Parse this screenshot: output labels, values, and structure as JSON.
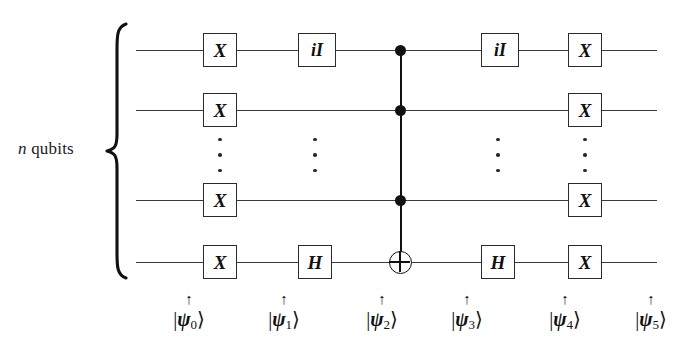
{
  "figure": {
    "type": "quantum-circuit-diagram",
    "left_label": {
      "symbol": "n",
      "text": "qubits"
    },
    "wire_count_shown": 4,
    "columns": [
      {
        "index": 0,
        "kind": "gate"
      },
      {
        "index": 1,
        "kind": "gate"
      },
      {
        "index": 2,
        "kind": "control-bus"
      },
      {
        "index": 3,
        "kind": "gate"
      },
      {
        "index": 4,
        "kind": "gate"
      }
    ]
  },
  "gates": {
    "row0": [
      {
        "label": "X",
        "x": 203,
        "wide": false
      },
      {
        "label": "iI",
        "x": 298,
        "wide": true
      },
      {
        "label": "iI",
        "x": 481,
        "wide": true
      },
      {
        "label": "X",
        "x": 568,
        "wide": false
      }
    ],
    "row1": [
      {
        "label": "X",
        "x": 203,
        "wide": false
      },
      {
        "label": "X",
        "x": 568,
        "wide": false
      }
    ],
    "row2": [
      {
        "label": "X",
        "x": 203,
        "wide": false
      },
      {
        "label": "X",
        "x": 568,
        "wide": false
      }
    ],
    "row3": [
      {
        "label": "X",
        "x": 203,
        "wide": false
      },
      {
        "label": "H",
        "x": 298,
        "wide": false
      },
      {
        "label": "H",
        "x": 481,
        "wide": false
      },
      {
        "label": "X",
        "x": 568,
        "wide": false
      }
    ]
  },
  "controls": {
    "bus_x": 400,
    "dots_rows": [
      0,
      1,
      2
    ],
    "target_row": 3,
    "target_symbol": "oplus"
  },
  "ellipsis": {
    "columns_x": [
      220,
      315,
      498,
      585
    ],
    "y": 138
  },
  "wires": {
    "y": [
      50,
      110,
      200,
      262
    ],
    "x_start": 136,
    "x_end": 657
  },
  "states": [
    {
      "arrow": "↑",
      "bra": "|",
      "psi": "ψ",
      "sub": "0",
      "ket": "⟩",
      "x": 153
    },
    {
      "arrow": "↑",
      "bra": "|",
      "psi": "ψ",
      "sub": "1",
      "ket": "⟩",
      "x": 248
    },
    {
      "arrow": "↑",
      "bra": "|",
      "psi": "ψ",
      "sub": "2",
      "ket": "⟩",
      "x": 346
    },
    {
      "arrow": "↑",
      "bra": "|",
      "psi": "ψ",
      "sub": "3",
      "ket": "⟩",
      "x": 431
    },
    {
      "arrow": "↑",
      "bra": "|",
      "psi": "ψ",
      "sub": "4",
      "ket": "⟩",
      "x": 529
    },
    {
      "arrow": "↑",
      "bra": "|",
      "psi": "ψ",
      "sub": "5",
      "ket": "⟩",
      "x": 615
    }
  ],
  "colors": {
    "ink": "#111111",
    "wire": "#3a3a3a",
    "background": "#ffffff"
  }
}
